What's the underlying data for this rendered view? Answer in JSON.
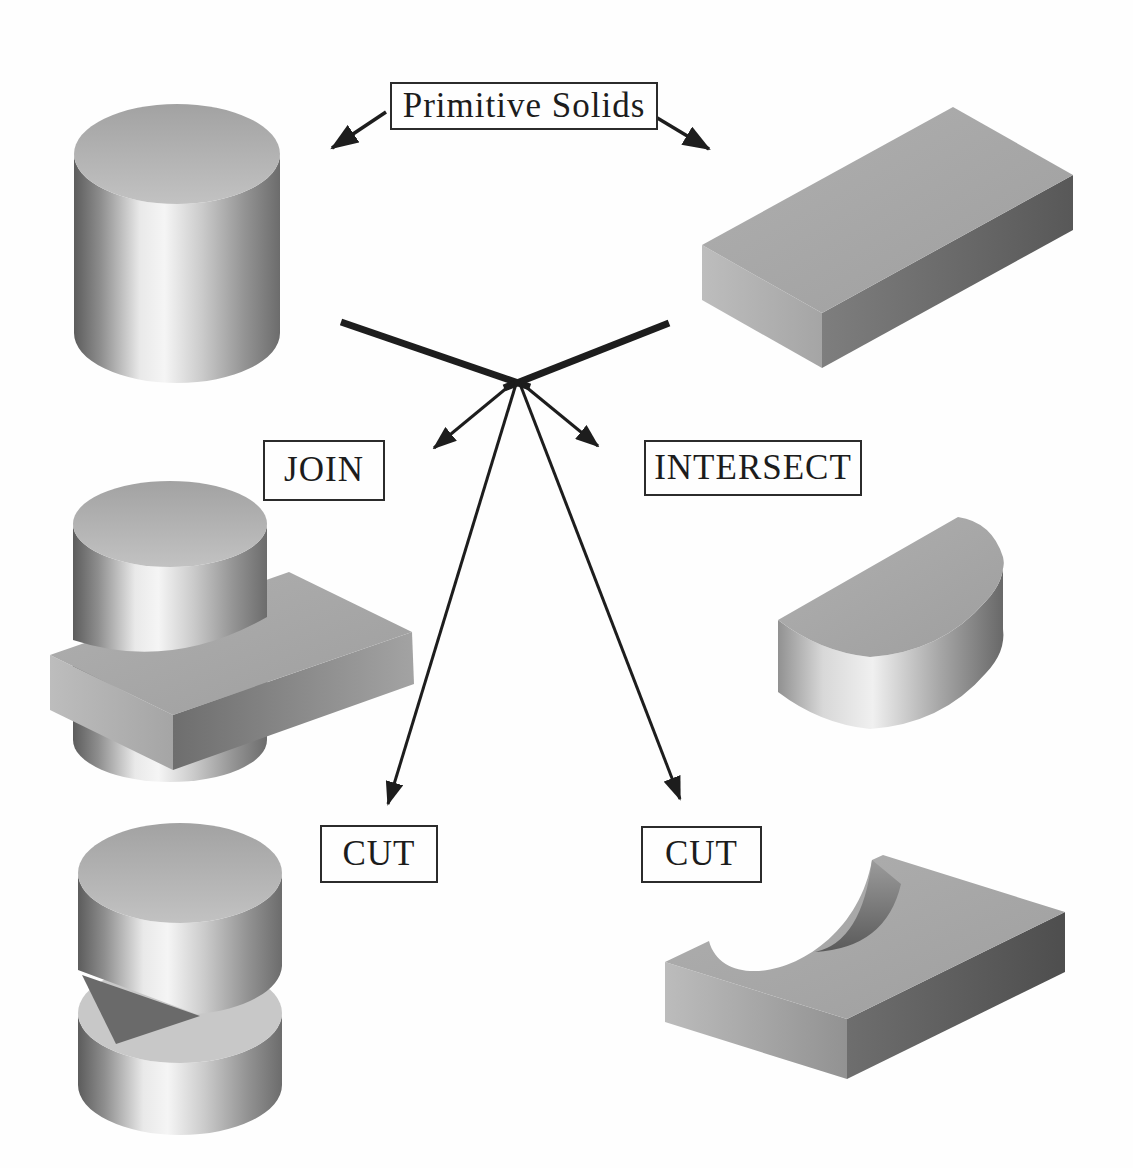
{
  "diagram": {
    "root_label": "Primitive Solids",
    "operation_labels": {
      "join": "JOIN",
      "intersect": "INTERSECT",
      "cut_left": "CUT",
      "cut_right": "CUT"
    },
    "solids": {
      "primitive_cylinder": "cylinder-primitive",
      "primitive_block": "rectangular-block-primitive",
      "join_result": "cylinder-joined-with-plate",
      "intersect_result": "half-cylinder-common-volume",
      "cut_left_result": "cylinder-with-slot-cut",
      "cut_right_result": "plate-with-cylindrical-notch"
    },
    "colors": {
      "background": "#fefefe",
      "ink": "#1d1d1d",
      "solid_highlight": "#f5f5f5",
      "solid_mid_gray": "#a8a8a8",
      "solid_dark_gray": "#585858"
    }
  }
}
